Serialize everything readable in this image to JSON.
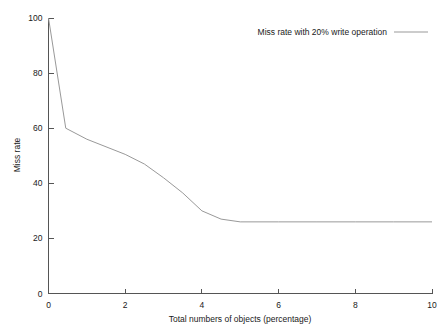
{
  "chart_data": {
    "type": "line",
    "title": "",
    "subtitle": "",
    "xlabel": "Total numbers of objects (percentage)",
    "ylabel": "Miss rate",
    "xlim": [
      0,
      10
    ],
    "ylim": [
      0,
      100
    ],
    "xticks": [
      "0",
      "2",
      "4",
      "6",
      "8",
      "10"
    ],
    "xtick_values": [
      0,
      2,
      4,
      6,
      8,
      10
    ],
    "yticks": [
      "0",
      "20",
      "40",
      "60",
      "80",
      "100"
    ],
    "ytick_values": [
      0,
      20,
      40,
      60,
      80,
      100
    ],
    "grid": false,
    "legend_position": "top-right",
    "series": [
      {
        "name": "Miss rate with 20% write operation",
        "color": "#999999",
        "x": [
          0,
          0.45,
          1.0,
          2.0,
          2.5,
          3.0,
          3.5,
          4.0,
          4.5,
          5.0,
          6.0,
          7.0,
          8.0,
          9.0,
          10.0
        ],
        "values": [
          100,
          60,
          56,
          50.5,
          47,
          42,
          36.5,
          30,
          27,
          26,
          26,
          26,
          26,
          26,
          26
        ]
      }
    ],
    "annotations": []
  },
  "legend": {
    "entries": [
      {
        "label": "Miss rate with 20% write operation",
        "swatch_color": "#999999"
      }
    ]
  },
  "colors": {
    "background": "#ffffff",
    "axis": "#555555",
    "text": "#1a1a1a",
    "series_1": "#999999"
  }
}
